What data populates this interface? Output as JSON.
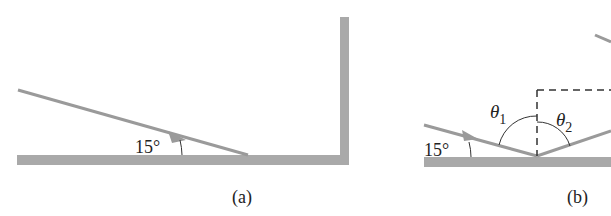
{
  "figure": {
    "panels": [
      {
        "id": "a",
        "caption": "(a)",
        "angle_label": "15°",
        "description": "Ray incident at 15° onto horizontal floor next to vertical wall"
      },
      {
        "id": "b",
        "caption": "(b)",
        "angle_label": "15°",
        "theta1_symbol": "θ",
        "theta1_sub": "1",
        "theta2_symbol": "θ",
        "theta2_sub": "2",
        "description": "Reflection geometry with dashed normal and angles θ1, θ2"
      }
    ],
    "colors": {
      "surface": "#a9a9a9",
      "ray": "#9a9a9a",
      "line": "#333333",
      "text": "#222222"
    }
  }
}
